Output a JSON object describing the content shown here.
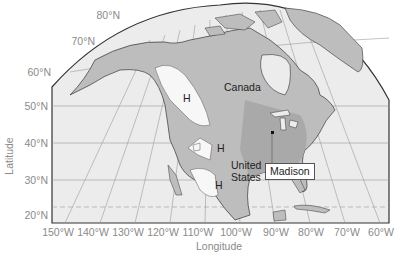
{
  "map": {
    "projection": "conic",
    "region": "North America",
    "colors": {
      "ocean": "#ececec",
      "land": "#bdbdbd",
      "land_dark": "#a6a6a6",
      "highlands": "#f7f7f7",
      "grid": "#9a9a9a",
      "frame": "#333333",
      "tick_text": "#8a8a8a"
    }
  },
  "axes": {
    "ylabel": "Latitude",
    "xlabel": "Longitude",
    "lat_ticks": [
      "80°N",
      "70°N",
      "60°N",
      "50°N",
      "40°N",
      "30°N",
      "20°N"
    ],
    "lon_ticks": [
      "150°W",
      "140°W",
      "130°W",
      "120°W",
      "110°W",
      "100°W",
      "90°W",
      "80°W",
      "70°W",
      "60°W"
    ]
  },
  "labels": {
    "canada": "Canada",
    "united_states_line1": "United",
    "united_states_line2": "States",
    "highland_1": "H",
    "highland_2": "H",
    "highland_3": "H",
    "madison": "Madison"
  }
}
